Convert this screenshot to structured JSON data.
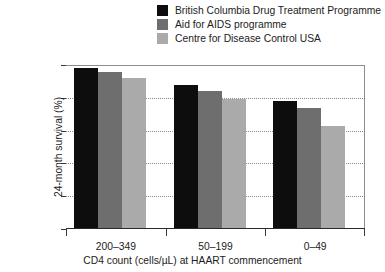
{
  "chart_data": {
    "type": "bar",
    "title": "",
    "xlabel": "CD4 count (cells/µL) at HAART commencement",
    "ylabel": "24-month survival (%)",
    "categories": [
      "200–349",
      "50–199",
      "0–49"
    ],
    "ylim": [
      0,
      100
    ],
    "yticks": [
      0,
      20,
      40,
      60,
      80,
      100
    ],
    "ytick_labels": [
      "0",
      "20",
      "40",
      "60",
      "80",
      "100"
    ],
    "grid": "horizontal-dotted",
    "legend_position": "top-right",
    "series": [
      {
        "name": "British Columbia Drug Treatment Programme",
        "color": "#0d0d0d",
        "values": [
          98,
          88,
          78
        ]
      },
      {
        "name": "Aid for AIDS programme",
        "color": "#6e6e6e",
        "values": [
          96,
          84,
          74
        ]
      },
      {
        "name": "Centre for Disease Control USA",
        "color": "#aaaaaa",
        "values": [
          92,
          79,
          63
        ]
      }
    ]
  }
}
